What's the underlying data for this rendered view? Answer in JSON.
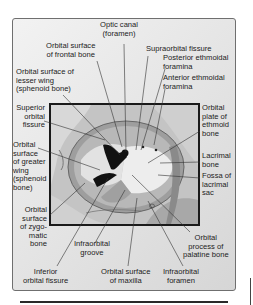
{
  "figure": {
    "labels": {
      "optic_canal": "Optic canal\n(foramen)",
      "frontal_bone": "Orbital surface\nof frontal bone",
      "supraorbital_fissure": "Supraorbital fissure",
      "posterior_ethmoidal": "Posterior ethmoidal\nforamina",
      "anterior_ethmoidal": "Anterior ethmoidal\nforamina",
      "lesser_wing": "Orbital surface of\nlesser wing\n(sphenoid bone)",
      "superior_orbital_fissure": "Superior\norbital\nfissure",
      "greater_wing": "Orbital\nsurface\nof greater\nwing\n(sphenoid\nbone)",
      "ethmoid_plate": "Orbital\nplate of\nethmoid\nbone",
      "lacrimal_bone": "Lacrimal\nbone",
      "lacrimal_fossa": "Fossa of\nlacrimal\nsac",
      "zygomatic": "Orbital\nsurface\nof zygo-\nmatic\nbone",
      "infraorbital_groove": "Infraorbital\ngroove",
      "palatine": "Orbital\nprocess of\npalatine bone",
      "inferior_orbital_fissure": "Inferior\norbital fissure",
      "maxilla": "Orbital surface\nof maxilla",
      "infraorbital_foramen": "Infraorbital\nforamen"
    },
    "colors": {
      "frame_border": "#6f6f6f",
      "bone_light": "#e8e8e8",
      "bone_mid": "#b0b0b0",
      "fissure_dark": "#111111"
    }
  }
}
